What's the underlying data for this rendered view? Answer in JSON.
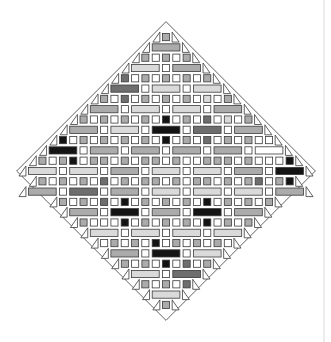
{
  "diagram": {
    "type": "diamond-mosaic",
    "center": [
      166,
      171
    ],
    "pitch": 10.3,
    "shades": {
      "W": "#ffffff",
      "L": "#dadada",
      "M": "#ababab",
      "D": "#6e6e6e",
      "K": "#141414"
    },
    "border_color": "#3a3a3a",
    "rows": [
      {
        "kind": "sq",
        "tiles": "M"
      },
      {
        "kind": "rc",
        "tiles": "M"
      },
      {
        "kind": "sq",
        "tiles": "MWMWM"
      },
      {
        "kind": "rc",
        "tiles": "LWM"
      },
      {
        "kind": "sq",
        "tiles": "DWMWMWMWM"
      },
      {
        "kind": "rc",
        "tiles": "DWLWL"
      },
      {
        "kind": "sq",
        "tiles": "MWDWMWMWMWLWM"
      },
      {
        "kind": "rc",
        "tiles": "MWLWLWM"
      },
      {
        "kind": "sq",
        "tiles": "MWMWMWMWKWMWDWLWM"
      },
      {
        "kind": "rc",
        "tiles": "MWLWKWDWM"
      },
      {
        "kind": "sq",
        "tiles": "KWMWMWMWMWKWMWDWMWMWW"
      },
      {
        "kind": "rc",
        "tiles": "KWMWMWMWMWW"
      },
      {
        "kind": "sq",
        "tiles": "MWMKWMMWMWMMWMWWMMMWMWWWK"
      },
      {
        "kind": "rc",
        "tiles": "LWLWMWLWLWMWK"
      },
      {
        "kind": "sq",
        "tiles": "MWMWMWDWMWMMWMWMMWMWMDWMK"
      },
      {
        "kind": "rc",
        "tiles": "MWDWMWLWLWLWM"
      },
      {
        "kind": "sq",
        "tiles": "MWMWDWKWMWMWMWKWMWMWM"
      },
      {
        "kind": "rc",
        "tiles": "MWKWMWKWM"
      },
      {
        "kind": "sq",
        "tiles": "MWWWKWMWMWMWKWMWM"
      },
      {
        "kind": "rc",
        "tiles": "LWLWLWL"
      },
      {
        "kind": "sq",
        "tiles": "WMWMWKWMWMWMW"
      },
      {
        "kind": "rc",
        "tiles": "MWKWL"
      },
      {
        "kind": "sq",
        "tiles": "MWMWKWDWM"
      },
      {
        "kind": "rc",
        "tiles": "LWD"
      },
      {
        "kind": "sq",
        "tiles": "MWMWD"
      },
      {
        "kind": "rc",
        "tiles": "L"
      },
      {
        "kind": "sq",
        "tiles": "M"
      }
    ]
  }
}
